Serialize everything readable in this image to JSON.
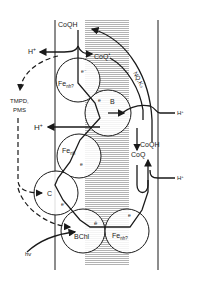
{
  "diagram": {
    "type": "photosynthetic bacterial electron transport scheme across membrane",
    "labels": {
      "coqh_top": "CoQH",
      "coq_minus": "CoQ",
      "coq_minus_sup": "•",
      "h_plus_top_left": "H",
      "h_plus_top_left_sup": "+",
      "tmpd": "TMPD,",
      "pms": "PMS",
      "h_plus_mid_left": "H",
      "h_plus_mid_left_sup": "+",
      "nq_k3": "NQ,K₃",
      "h_plus_right_upper": "H",
      "h_plus_right_upper_sup": "+",
      "coqh_right": "CoQH",
      "coq_right": "CoQ",
      "h_plus_right_lower": "H",
      "h_plus_right_lower_sup": "+",
      "fe_nh_top": "Fe",
      "fe_nh_top_sub": "nh?",
      "e_top": "e⁻",
      "b": "B",
      "e_b": "e",
      "fe_nh_mid": "Fe",
      "fe_nh_mid_sub": "nh",
      "e_mid": "e",
      "c": "C",
      "e_c": "e⁻",
      "e_bar": "ē",
      "bchl": "BChl",
      "fe_nh_bottom": "Fe",
      "fe_nh_bottom_sub": "nh?",
      "e_bottom": "e",
      "hv": "hv"
    },
    "colors": {
      "line": "#1a1a1a",
      "shading": "#9a9a9a",
      "background": "#ffffff"
    }
  }
}
